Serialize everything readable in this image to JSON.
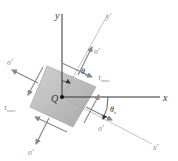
{
  "diagram": {
    "axes": {
      "x": "x",
      "y": "y",
      "x_prime": "x'",
      "y_prime": "y'"
    },
    "origin_label": "Q",
    "labels": {
      "sigma_prime": "σ'",
      "tau": "τ",
      "tau_sub": "max",
      "theta": "θ",
      "theta_sub": "s"
    },
    "colors": {
      "element_fill": "#b8b8b8",
      "axis": "#333333",
      "rotated_axis": "#9a9a9a",
      "arrow": "#8a8a8a"
    }
  }
}
